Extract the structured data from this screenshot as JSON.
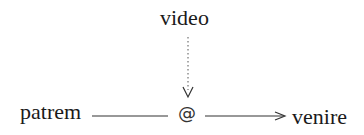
{
  "diagram": {
    "nodes": {
      "top": "video",
      "left": "patrem",
      "right": "venire",
      "center": "@"
    },
    "edges": [
      {
        "from": "video",
        "to": "@",
        "style": "dotted",
        "arrow": "open-v"
      },
      {
        "from": "patrem",
        "to": "@",
        "style": "solid",
        "arrow": "none"
      },
      {
        "from": "@",
        "to": "venire",
        "style": "solid",
        "arrow": "open"
      }
    ],
    "colors": {
      "text": "#1a1a1a",
      "line": "#333333",
      "background": "#ffffff"
    }
  }
}
